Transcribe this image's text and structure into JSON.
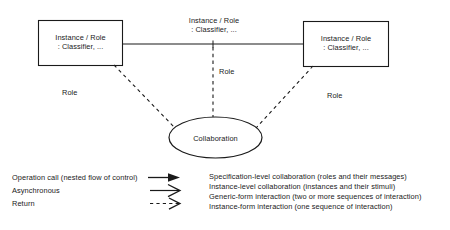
{
  "diagram": {
    "type": "uml-collaboration-diagram",
    "nodes": {
      "left_instance": {
        "line1": "Instance / Role",
        "line2": ": Classifier, ..."
      },
      "right_instance": {
        "line1": "Instance / Role",
        "line2": ": Classifier, ..."
      },
      "association_label": {
        "line1": "Instance / Role",
        "line2": ": Classifier, ..."
      },
      "collaboration": {
        "label": "Collaboration"
      }
    },
    "edge_labels": {
      "left_role": "Role",
      "center_role": "Role",
      "right_role": "Role"
    }
  },
  "legend": {
    "notation_rows": [
      {
        "label": "Operation call (nested flow of control)",
        "glyph": "filled-arrow-icon"
      },
      {
        "label": "Asynchronous",
        "glyph": "open-arrow-icon"
      },
      {
        "label": "Return",
        "glyph": "dashed-open-arrow-icon"
      }
    ],
    "description_rows": [
      {
        "label": "Specification-level collaboration (roles and their messages)"
      },
      {
        "label": "Instance-level collaboration (instances and their stimuli)"
      },
      {
        "label": "Generic-form interaction (two or more sequences of interaction)"
      },
      {
        "label": "Instance-form interaction (one sequence of interaction)"
      }
    ]
  },
  "colors": {
    "stroke": "#1a1a1a",
    "text": "#1a1a1a",
    "background": "#ffffff"
  }
}
